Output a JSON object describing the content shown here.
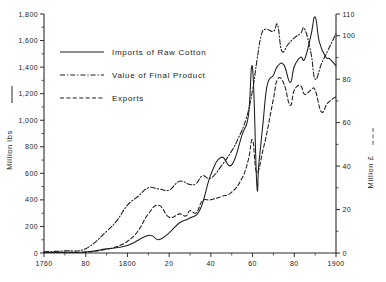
{
  "chart_data": {
    "type": "line",
    "title": "",
    "subtitle": "",
    "xlabel": "",
    "ylabel": "Million lbs",
    "y2label": "Million £",
    "xlim": [
      1760,
      1900
    ],
    "ylim": [
      0,
      1800
    ],
    "y2lim": [
      0,
      110
    ],
    "grid": false,
    "legend_position": "top-left",
    "x_tick_labels": [
      "1760",
      "80",
      "1800",
      "20",
      "40",
      "60",
      "80",
      "1900"
    ],
    "x_tick_values": [
      1760,
      1780,
      1800,
      1820,
      1840,
      1860,
      1880,
      1900
    ],
    "y_tick_labels": [
      "0",
      "200",
      "400",
      "600",
      "800",
      "1,000",
      "1,200",
      "1,400",
      "1,600",
      "1,800"
    ],
    "y_tick_values": [
      0,
      200,
      400,
      600,
      800,
      1000,
      1200,
      1400,
      1600,
      1800
    ],
    "y2_tick_labels": [
      "0",
      "20",
      "40",
      "60",
      "80",
      "100",
      "110"
    ],
    "y2_tick_values": [
      0,
      20,
      40,
      60,
      80,
      100,
      110
    ],
    "series": [
      {
        "name": "Imports of Raw Cotton",
        "style": "solid",
        "axis": "left",
        "units": "Million lbs",
        "x": [
          1760,
          1770,
          1780,
          1790,
          1800,
          1810,
          1815,
          1820,
          1825,
          1830,
          1835,
          1840,
          1845,
          1850,
          1855,
          1858,
          1860,
          1862,
          1863,
          1865,
          1867,
          1870,
          1872,
          1875,
          1878,
          1880,
          1883,
          1885,
          1888,
          1890,
          1892,
          1895,
          1897,
          1900
        ],
        "values": [
          3,
          5,
          7,
          31,
          56,
          132,
          100,
          152,
          228,
          264,
          333,
          592,
          721,
          664,
          891,
          1035,
          1391,
          524,
          669,
          978,
          1263,
          1339,
          1408,
          1417,
          1285,
          1405,
          1475,
          1461,
          1640,
          1778,
          1590,
          1478,
          1462,
          1410
        ]
      },
      {
        "name": "Value of Final Product",
        "style": "dash-dot",
        "axis": "right",
        "units": "Million £",
        "x": [
          1760,
          1770,
          1780,
          1790,
          1795,
          1800,
          1805,
          1810,
          1815,
          1820,
          1825,
          1830,
          1833,
          1836,
          1840,
          1845,
          1850,
          1853,
          1857,
          1860,
          1862,
          1864,
          1866,
          1870,
          1872,
          1874,
          1877,
          1880,
          1883,
          1885,
          1888,
          1890,
          1893,
          1896,
          1900
        ],
        "values": [
          0.6,
          1.0,
          2.0,
          10.0,
          15.0,
          22.0,
          26.0,
          30.0,
          29.5,
          29.0,
          33.0,
          31.5,
          32.0,
          35.5,
          34.5,
          40.0,
          47.0,
          52.5,
          62.0,
          75.0,
          88.0,
          99.5,
          103.0,
          102.0,
          105.0,
          93.0,
          96.0,
          99.0,
          101.0,
          103.0,
          92.0,
          80.0,
          87.0,
          93.0,
          101.0
        ]
      },
      {
        "name": "Exports",
        "style": "dashed",
        "axis": "right",
        "units": "Million £",
        "x": [
          1760,
          1770,
          1780,
          1790,
          1795,
          1800,
          1805,
          1810,
          1815,
          1820,
          1825,
          1828,
          1830,
          1833,
          1836,
          1840,
          1845,
          1850,
          1855,
          1858,
          1860,
          1862,
          1865,
          1867,
          1870,
          1872,
          1875,
          1878,
          1880,
          1883,
          1885,
          1888,
          1890,
          1893,
          1896,
          1900
        ],
        "values": [
          0.2,
          0.3,
          0.4,
          1.7,
          3.0,
          5.4,
          10.0,
          18.0,
          22.0,
          16.5,
          18.0,
          17.0,
          19.5,
          18.5,
          24.0,
          24.5,
          26.0,
          28.0,
          34.5,
          43.0,
          52.0,
          37.0,
          47.5,
          56.0,
          71.0,
          80.0,
          78.0,
          68.0,
          75.0,
          77.0,
          73.0,
          75.0,
          75.0,
          65.0,
          69.0,
          72.0
        ]
      }
    ],
    "legend": [
      {
        "label": "Imports of Raw Cotton",
        "style": "solid"
      },
      {
        "label": "Value of Final Product",
        "style": "dash-dot"
      },
      {
        "label": "Exports",
        "style": "dashed"
      }
    ],
    "annotations": []
  }
}
